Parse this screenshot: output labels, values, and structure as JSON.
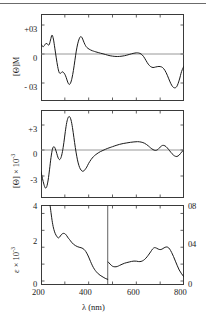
{
  "figure": {
    "type": "multi-panel-spectrum",
    "xaxis_label_main": "λ",
    "xaxis_label_units": "(nm)"
  },
  "chart_data": [
    {
      "type": "line",
      "panel": "top",
      "title": "",
      "ylabel": "[Θ]M",
      "xlabel": "",
      "xlim": [
        200,
        800
      ],
      "ylim": [
        -4.6,
        4.6
      ],
      "xticks_major": [
        200,
        400,
        600,
        800
      ],
      "xticks_minor": [
        300,
        500,
        700
      ],
      "yticks": [
        3,
        0,
        -3
      ],
      "ytick_labels": [
        "+03",
        "0",
        "- 03"
      ],
      "grid": false,
      "zero_line": true,
      "series": [
        {
          "name": "MCD [Theta]M",
          "x": [
            200,
            208,
            215,
            221,
            228,
            234,
            240,
            246,
            252,
            258,
            264,
            270,
            276,
            282,
            288,
            294,
            300,
            306,
            312,
            318,
            324,
            330,
            336,
            342,
            348,
            354,
            360,
            366,
            372,
            378,
            384,
            390,
            396,
            402,
            408,
            414,
            420,
            430,
            440,
            450,
            460,
            470,
            480,
            490,
            500,
            510,
            520,
            530,
            540,
            550,
            560,
            570,
            580,
            590,
            600,
            610,
            620,
            630,
            640,
            650,
            660,
            670,
            680,
            690,
            700,
            710,
            720,
            730,
            740,
            750,
            760,
            770,
            780,
            790,
            800
          ],
          "y": [
            1.05,
            0.75,
            0.9,
            1.1,
            1.0,
            0.95,
            1.45,
            1.95,
            1.55,
            0.6,
            -0.4,
            -1.3,
            -1.9,
            -2.0,
            -1.85,
            -1.9,
            -2.1,
            -2.45,
            -2.9,
            -3.15,
            -3.0,
            -2.5,
            -1.7,
            -0.7,
            0.3,
            1.05,
            1.55,
            1.8,
            1.7,
            1.35,
            1.0,
            0.75,
            0.6,
            0.5,
            0.42,
            0.35,
            0.3,
            0.22,
            0.15,
            0.08,
            0.02,
            -0.05,
            -0.12,
            -0.18,
            -0.22,
            -0.25,
            -0.26,
            -0.25,
            -0.22,
            -0.18,
            -0.12,
            -0.05,
            0.02,
            0.08,
            0.12,
            0.1,
            0.0,
            -0.25,
            -0.65,
            -1.05,
            -1.3,
            -1.4,
            -1.35,
            -1.3,
            -1.3,
            -1.4,
            -1.7,
            -2.2,
            -2.8,
            -3.3,
            -3.5,
            -3.35,
            -2.7,
            -1.8,
            -1.25
          ]
        }
      ]
    },
    {
      "type": "line",
      "panel": "middle",
      "title": "",
      "ylabel": "[Θ] × 10-3",
      "xlabel": "",
      "xlim": [
        200,
        800
      ],
      "ylim": [
        -5.0,
        5.0
      ],
      "xticks_major": [
        200,
        400,
        600,
        800
      ],
      "xticks_minor": [
        300,
        500,
        700
      ],
      "yticks": [
        3,
        0,
        -3
      ],
      "ytick_labels": [
        "+3",
        "0",
        "-3"
      ],
      "grid": false,
      "zero_line": true,
      "series": [
        {
          "name": "CD [Theta] x 10^-3",
          "x": [
            200,
            206,
            212,
            218,
            224,
            230,
            236,
            242,
            248,
            254,
            260,
            266,
            272,
            278,
            284,
            290,
            296,
            302,
            308,
            314,
            320,
            326,
            332,
            338,
            344,
            350,
            356,
            362,
            368,
            374,
            380,
            386,
            392,
            400,
            410,
            420,
            430,
            440,
            450,
            460,
            470,
            480,
            490,
            500,
            515,
            530,
            545,
            560,
            575,
            590,
            605,
            620,
            635,
            650,
            660,
            670,
            680,
            690,
            700,
            710,
            720,
            730,
            740,
            750,
            760,
            770,
            780,
            790,
            800
          ],
          "y": [
            -2.6,
            -3.4,
            -4.1,
            -4.55,
            -4.4,
            -3.6,
            -2.3,
            -0.9,
            0.1,
            0.4,
            0.15,
            -0.4,
            -0.95,
            -1.15,
            -0.9,
            -0.2,
            0.9,
            2.2,
            3.3,
            3.9,
            4.0,
            3.6,
            2.7,
            1.5,
            0.3,
            -0.75,
            -1.55,
            -2.1,
            -2.4,
            -2.55,
            -2.5,
            -2.3,
            -2.05,
            -1.6,
            -1.15,
            -0.8,
            -0.55,
            -0.35,
            -0.18,
            -0.05,
            0.08,
            0.2,
            0.3,
            0.4,
            0.55,
            0.68,
            0.78,
            0.85,
            0.92,
            0.97,
            1.0,
            0.95,
            0.8,
            0.5,
            0.25,
            0.05,
            -0.05,
            0.05,
            0.35,
            0.55,
            0.5,
            0.25,
            -0.1,
            -0.45,
            -0.7,
            -0.78,
            -0.6,
            -0.25,
            0.05
          ]
        }
      ]
    },
    {
      "type": "line",
      "panel": "bottom",
      "title": "",
      "ylabel": "ε × 10-3",
      "ylabel_right": "",
      "xlabel": "λ (nm)",
      "xlim": [
        200,
        800
      ],
      "ylim": [
        0,
        4.5
      ],
      "ylim_right": [
        0,
        0.9
      ],
      "xticks_major": [
        200,
        400,
        600,
        800
      ],
      "xticks_minor": [
        300,
        500,
        700
      ],
      "yticks": [
        0,
        2,
        4
      ],
      "ytick_labels": [
        "0",
        "2",
        "4"
      ],
      "yticks_right": [
        0,
        0.4,
        0.8
      ],
      "ytick_labels_right": [
        "0",
        "04",
        "08"
      ],
      "scale_break_x": 480,
      "grid": false,
      "series": [
        {
          "name": "absorption left-scale (200-480 nm)",
          "scale": "left",
          "x": [
            238,
            242,
            248,
            254,
            260,
            266,
            272,
            278,
            284,
            290,
            296,
            302,
            308,
            314,
            320,
            328,
            336,
            344,
            352,
            360,
            368,
            376,
            384,
            392,
            400,
            408,
            416,
            424,
            432,
            440,
            448,
            456,
            464,
            472,
            480
          ],
          "y": [
            4.5,
            4.05,
            3.45,
            3.05,
            2.8,
            2.65,
            2.55,
            2.6,
            2.72,
            2.8,
            2.82,
            2.78,
            2.68,
            2.55,
            2.45,
            2.3,
            2.18,
            2.1,
            2.04,
            2.0,
            1.97,
            1.92,
            1.82,
            1.65,
            1.42,
            1.15,
            0.9,
            0.7,
            0.55,
            0.43,
            0.34,
            0.27,
            0.2,
            0.14,
            0.1
          ]
        },
        {
          "name": "absorption right-scale (480-810 nm)",
          "scale": "right",
          "x": [
            482,
            490,
            500,
            510,
            520,
            530,
            540,
            550,
            560,
            570,
            580,
            590,
            600,
            610,
            620,
            630,
            640,
            650,
            660,
            668,
            676,
            684,
            692,
            700,
            708,
            716,
            724,
            732,
            740,
            748,
            756,
            764,
            772,
            780,
            790,
            800,
            808
          ],
          "y": [
            0.225,
            0.2,
            0.175,
            0.168,
            0.172,
            0.185,
            0.198,
            0.21,
            0.218,
            0.225,
            0.232,
            0.236,
            0.235,
            0.23,
            0.232,
            0.245,
            0.27,
            0.305,
            0.345,
            0.378,
            0.395,
            0.39,
            0.378,
            0.372,
            0.378,
            0.392,
            0.402,
            0.4,
            0.378,
            0.338,
            0.29,
            0.235,
            0.18,
            0.13,
            0.085,
            0.048,
            0.02
          ]
        }
      ]
    }
  ]
}
